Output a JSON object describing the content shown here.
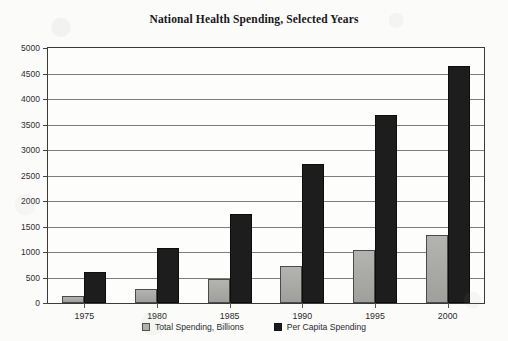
{
  "chart_data": {
    "type": "bar",
    "title": "National Health Spending, Selected Years",
    "xlabel": "",
    "ylabel": "",
    "categories": [
      "1975",
      "1980",
      "1985",
      "1990",
      "1995",
      "2000"
    ],
    "series": [
      {
        "name": "Total Spending, Billions",
        "color": "#a9a9a6",
        "values": [
          130,
          270,
          470,
          730,
          1030,
          1340
        ]
      },
      {
        "name": "Per Capita Spending",
        "color": "#1d1d1d",
        "values": [
          600,
          1075,
          1750,
          2720,
          3690,
          4650
        ]
      }
    ],
    "ylim": [
      0,
      5000
    ],
    "yticks": [
      0,
      500,
      1000,
      1500,
      2000,
      2500,
      3000,
      3500,
      4000,
      4500,
      5000
    ],
    "ytick_labels": [
      "0",
      "500",
      "1000",
      "1500",
      "2000",
      "2500",
      "3000",
      "3500",
      "4000",
      "4500",
      "5000"
    ],
    "grid": true,
    "legend_position": "bottom-center"
  },
  "legend": {
    "items": [
      {
        "label": "Total Spending, Billions",
        "swatch": "gray-square-swatch"
      },
      {
        "label": "Per Capita Spending",
        "swatch": "black-square-swatch"
      }
    ]
  }
}
